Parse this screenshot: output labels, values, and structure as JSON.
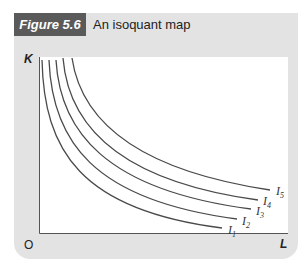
{
  "figure": {
    "tag": "Figure 5.6",
    "title": "An isoquant map"
  },
  "axes": {
    "y_label": "K",
    "x_label": "L",
    "origin_label": "O"
  },
  "colors": {
    "panel_bg": "#e3e3e3",
    "tag_bg": "#5a5a5a",
    "curve": "#4a4a4a"
  },
  "curves": [
    {
      "label": "I",
      "subscript": "1"
    },
    {
      "label": "I",
      "subscript": "2"
    },
    {
      "label": "I",
      "subscript": "3"
    },
    {
      "label": "I",
      "subscript": "4"
    },
    {
      "label": "I",
      "subscript": "5"
    }
  ]
}
